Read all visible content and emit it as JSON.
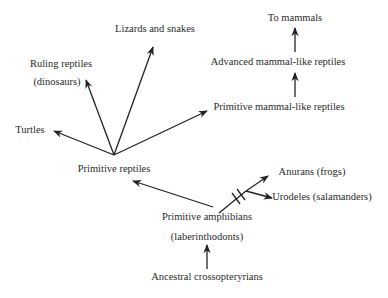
{
  "diagram": {
    "type": "evolutionary-tree",
    "nodes": {
      "ancestral": "Ancestral crossopteryrians",
      "primitive_amphibians": "Primitive amphibians",
      "primitive_amphibians_sub": "(laberinthodonts)",
      "anurans": "Anurans (frogs)",
      "urodeles": "Urodeles (salamanders)",
      "primitive_reptiles": "Primitive  reptiles",
      "turtles": "Turtles",
      "ruling_reptiles": "Ruling reptiles",
      "ruling_reptiles_sub": "(dinosaurs)",
      "lizards": "Lizards and snakes",
      "primitive_mammal_like": "Primitive mammal-like reptiles",
      "advanced_mammal_like": "Advanced mammal-like reptiles",
      "to_mammals": "To mammals"
    },
    "edges": [
      [
        "ancestral",
        "primitive_amphibians"
      ],
      [
        "primitive_amphibians",
        "primitive_reptiles"
      ],
      [
        "primitive_amphibians",
        "anurans"
      ],
      [
        "primitive_amphibians",
        "urodeles"
      ],
      [
        "primitive_reptiles",
        "turtles"
      ],
      [
        "primitive_reptiles",
        "ruling_reptiles"
      ],
      [
        "primitive_reptiles",
        "lizards"
      ],
      [
        "primitive_reptiles",
        "primitive_mammal_like"
      ],
      [
        "primitive_mammal_like",
        "advanced_mammal_like"
      ],
      [
        "advanced_mammal_like",
        "to_mammals"
      ]
    ],
    "line_color": "#222222"
  }
}
